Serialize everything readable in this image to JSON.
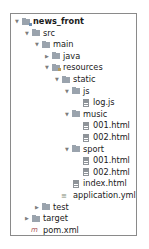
{
  "tree": [
    {
      "label": "news_front",
      "icon": "module-folder-icon",
      "expanded": true,
      "bold": true,
      "depth": 0
    },
    {
      "label": "src",
      "icon": "folder-icon",
      "expanded": true,
      "depth": 1
    },
    {
      "label": "main",
      "icon": "folder-icon",
      "expanded": true,
      "depth": 2
    },
    {
      "label": "java",
      "icon": "folder-icon",
      "expanded": false,
      "depth": 3
    },
    {
      "label": "resources",
      "icon": "resources-folder-icon",
      "expanded": true,
      "depth": 3
    },
    {
      "label": "static",
      "icon": "folder-icon",
      "expanded": true,
      "depth": 4
    },
    {
      "label": "js",
      "icon": "folder-icon",
      "expanded": true,
      "depth": 5
    },
    {
      "label": "log.js",
      "icon": "file-icon",
      "depth": 6
    },
    {
      "label": "music",
      "icon": "folder-icon",
      "expanded": true,
      "depth": 5
    },
    {
      "label": "001.html",
      "icon": "file-icon",
      "depth": 6
    },
    {
      "label": "002.html",
      "icon": "file-icon",
      "depth": 6
    },
    {
      "label": "sport",
      "icon": "folder-icon",
      "expanded": true,
      "depth": 5
    },
    {
      "label": "001.html",
      "icon": "file-icon",
      "depth": 6
    },
    {
      "label": "002.html",
      "icon": "file-icon",
      "depth": 6
    },
    {
      "label": "index.html",
      "icon": "file-icon",
      "depth": 5
    },
    {
      "label": "application.yml",
      "icon": "yml-file-icon",
      "depth": 4
    },
    {
      "label": "test",
      "icon": "folder-icon",
      "expanded": false,
      "depth": 2
    },
    {
      "label": "target",
      "icon": "folder-icon",
      "expanded": false,
      "depth": 1
    },
    {
      "label": "pom.xml",
      "icon": "maven-file-icon",
      "depth": 1
    }
  ]
}
